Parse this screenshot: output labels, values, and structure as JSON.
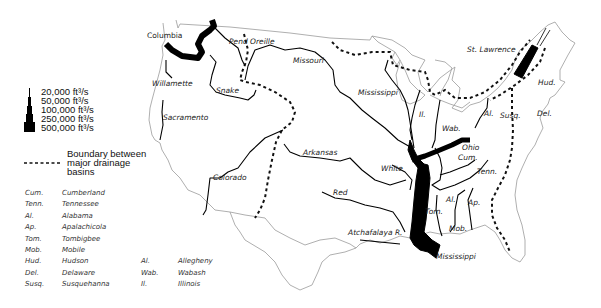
{
  "legend": {
    "flow_scale": [
      {
        "label": "20,000 ft³/s"
      },
      {
        "label": "50,000 ft³/s"
      },
      {
        "label": "100,000 ft³/s"
      },
      {
        "label": "250,000 ft³/s"
      },
      {
        "label": "500,000 ft³/s"
      }
    ],
    "boundary": {
      "line1": "Boundary between",
      "line2": "major drainage",
      "line3": "basins"
    }
  },
  "abbreviations": {
    "col1": [
      {
        "abbr": "Cum.",
        "name": "Cumberland"
      },
      {
        "abbr": "Tenn.",
        "name": "Tennessee"
      },
      {
        "abbr": "Al.",
        "name": "Alabama"
      },
      {
        "abbr": "Ap.",
        "name": "Apalachicola"
      },
      {
        "abbr": "Tom.",
        "name": "Tombigbee"
      },
      {
        "abbr": "Mob.",
        "name": "Mobile"
      },
      {
        "abbr": "Hud.",
        "name": "Hudson"
      },
      {
        "abbr": "Del.",
        "name": "Delaware"
      },
      {
        "abbr": "Susq.",
        "name": "Susquehanna"
      }
    ],
    "col2": [
      {
        "abbr": "Al.",
        "name": "Allegheny"
      },
      {
        "abbr": "Wab.",
        "name": "Wabash"
      },
      {
        "abbr": "Il.",
        "name": "Illinois"
      }
    ]
  },
  "rivers": {
    "columbia": "Columbia",
    "pend_oreille": "Pend Oreille",
    "missouri": "Missouri",
    "willamette": "Willamette",
    "snake": "Snake",
    "sacramento": "Sacramento",
    "mississippi_upper": "Mississippi",
    "st_lawrence": "St. Lawrence",
    "hud": "Hud.",
    "del": "Del.",
    "susq": "Susq.",
    "al_allegheny": "Al.",
    "il": "Il.",
    "wab": "Wab.",
    "ohio": "Ohio",
    "cum": "Cum.",
    "tenn": "Tenn.",
    "arkansas": "Arkansas",
    "white": "White",
    "colorado": "Colorado",
    "red": "Red",
    "tom": "Tom.",
    "al_alabama": "Al.",
    "ap": "Ap.",
    "mob": "Mob.",
    "atchafalaya": "Atchafalaya R.",
    "mississippi_mouth": "Mississippi"
  },
  "colors": {
    "river": "#000000",
    "outline": "#9a9a9a",
    "boundary": "#111111",
    "label": "#222222"
  }
}
